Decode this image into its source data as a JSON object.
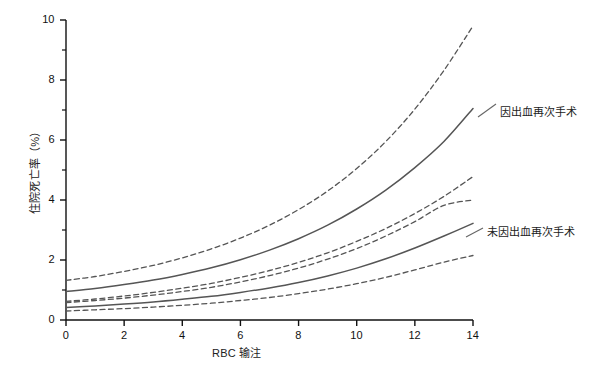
{
  "chart_data": {
    "type": "line",
    "title": "",
    "xlabel": "RBC 输注",
    "ylabel": "住院死亡率（%）",
    "xlim": [
      0,
      14
    ],
    "ylim": [
      0,
      10
    ],
    "xticks": [
      0,
      2,
      4,
      6,
      8,
      10,
      12,
      14
    ],
    "yticks": [
      0,
      2,
      4,
      6,
      8,
      10
    ],
    "y_minor_ticks": [
      1,
      3,
      5,
      7,
      9
    ],
    "grid": false,
    "legend_position": "inline-annotation",
    "x": [
      0,
      1,
      2,
      3,
      4,
      5,
      6,
      7,
      8,
      9,
      10,
      11,
      12,
      13,
      14
    ],
    "series": [
      {
        "name": "因出血再次手术",
        "style": "solid",
        "color": "#555555",
        "values": [
          0.95,
          1.05,
          1.18,
          1.33,
          1.52,
          1.74,
          2.01,
          2.33,
          2.71,
          3.16,
          3.7,
          4.33,
          5.08,
          5.95,
          7.05
        ]
      },
      {
        "name": "因出血再次手术 上界",
        "style": "dashed",
        "color": "#555555",
        "values": [
          1.32,
          1.45,
          1.62,
          1.82,
          2.07,
          2.37,
          2.73,
          3.16,
          3.68,
          4.3,
          5.05,
          5.95,
          7.03,
          8.32,
          9.8
        ]
      },
      {
        "name": "因出血再次手术 下界",
        "style": "dashed",
        "color": "#555555",
        "values": [
          0.62,
          0.7,
          0.8,
          0.92,
          1.06,
          1.22,
          1.42,
          1.65,
          1.92,
          2.24,
          2.62,
          3.05,
          3.55,
          4.12,
          4.78
        ]
      },
      {
        "name": "未因出血再次手术",
        "style": "solid",
        "color": "#555555",
        "values": [
          0.42,
          0.47,
          0.53,
          0.6,
          0.69,
          0.79,
          0.92,
          1.07,
          1.25,
          1.47,
          1.73,
          2.04,
          2.4,
          2.8,
          3.22
        ]
      },
      {
        "name": "未因出血再次手术 上界",
        "style": "dashed",
        "color": "#555555",
        "values": [
          0.58,
          0.65,
          0.73,
          0.83,
          0.95,
          1.09,
          1.27,
          1.48,
          1.73,
          2.03,
          2.38,
          2.8,
          3.28,
          3.82,
          4.0
        ]
      },
      {
        "name": "未因出血再次手术 下界",
        "style": "dashed",
        "color": "#555555",
        "values": [
          0.3,
          0.34,
          0.38,
          0.43,
          0.49,
          0.56,
          0.65,
          0.75,
          0.88,
          1.03,
          1.21,
          1.42,
          1.67,
          1.93,
          2.15
        ]
      }
    ],
    "annotations": [
      {
        "text": "因出血再次手术",
        "x": 14,
        "y": 7.05
      },
      {
        "text": "未因出血再次手术",
        "x": 14,
        "y": 3.22
      }
    ]
  },
  "axes": {
    "ylabel": "住院死亡率（%）",
    "xlabel": "RBC 输注",
    "xtick_labels": [
      "0",
      "2",
      "4",
      "6",
      "8",
      "10",
      "12",
      "14"
    ],
    "ytick_labels": [
      "0",
      "2",
      "4",
      "6",
      "8",
      "10"
    ]
  },
  "annotations": {
    "reoperation": "因出血再次手术",
    "no_reoperation": "未因出血再次手术"
  },
  "colors": {
    "line": "#555555",
    "axis": "#111111",
    "background": "#ffffff",
    "text": "#222222"
  }
}
